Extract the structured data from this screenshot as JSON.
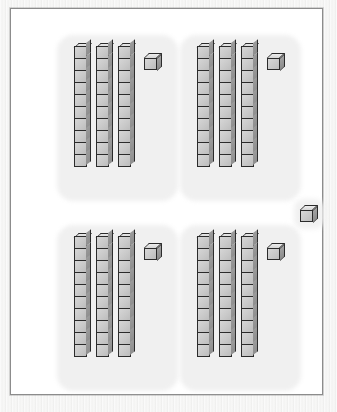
{
  "image": {
    "title": "Base-Ten Blocks Place Value Illustration",
    "description": "Four grouped sets of base-ten blocks plus one loose unit cube",
    "background_color": "#ffffff",
    "paper_color": "#f0f0ef",
    "frame_border_color": "#8c8c8c",
    "halo_color": "#f0f0f0"
  },
  "block_appearance": {
    "front_face_color": "#c9c9c9",
    "top_face_color": "#e0e0e0",
    "side_face_color": "#949494",
    "outline_color": "#2b2b2b"
  },
  "totals": {
    "rod_value": 10,
    "cube_value": 1,
    "group_count": 4,
    "rods_per_group": 3,
    "units_per_group": 1,
    "value_per_group": 31,
    "loose_cubes": 1,
    "grand_total": 125
  },
  "groups": [
    {
      "name": "group-top-left",
      "position": "top-left",
      "rods": 3,
      "cubes_per_rod": 10,
      "unit_cubes": 1,
      "value": 31,
      "x": 57,
      "y": 38,
      "rod_x": [
        6,
        28,
        50
      ],
      "cube_x": 76,
      "cube_y": 6
    },
    {
      "name": "group-top-right",
      "position": "top-right",
      "rods": 3,
      "cubes_per_rod": 10,
      "unit_cubes": 1,
      "value": 31,
      "x": 180,
      "y": 38,
      "rod_x": [
        6,
        28,
        50
      ],
      "cube_x": 76,
      "cube_y": 6
    },
    {
      "name": "group-bottom-left",
      "position": "bottom-left",
      "rods": 3,
      "cubes_per_rod": 10,
      "unit_cubes": 1,
      "value": 31,
      "x": 57,
      "y": 228,
      "rod_x": [
        6,
        28,
        50
      ],
      "cube_x": 76,
      "cube_y": 6
    },
    {
      "name": "group-bottom-right",
      "position": "bottom-right",
      "rods": 3,
      "cubes_per_rod": 10,
      "unit_cubes": 1,
      "value": 31,
      "x": 180,
      "y": 228,
      "rod_x": [
        6,
        28,
        50
      ],
      "cube_x": 76,
      "cube_y": 6
    }
  ],
  "loose_cube": {
    "name": "loose-unit-cube",
    "value": 1,
    "x": 289,
    "y": 196
  }
}
